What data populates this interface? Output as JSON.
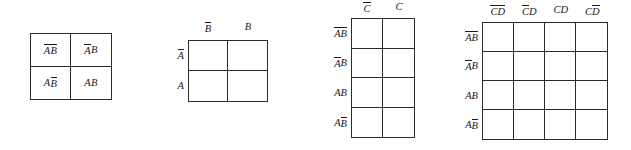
{
  "figure": {
    "type": "karnaugh-map-series",
    "background": "#ffffff",
    "ink": "#1a1a1a",
    "maps": [
      {
        "id": "map1",
        "name": "two-variable-kmap-filled",
        "variables": [
          "A",
          "B"
        ],
        "columns": 2,
        "rows": 2,
        "column_headers": [],
        "row_headers": [],
        "cells": [
          {
            "html": "<i class=\"ov\">A</i> <i class=\"ov\">B</i>",
            "text": "A̅ B̅"
          },
          {
            "html": "<i class=\"ov\">A</i> <i>B</i>",
            "text": "A̅ B"
          },
          {
            "html": "<i>A</i> <i class=\"ov\">B</i>",
            "text": "A B̅"
          },
          {
            "html": "<i>A</i> <i>B</i>",
            "text": "A B"
          }
        ]
      },
      {
        "id": "map2",
        "name": "two-variable-kmap-labeled",
        "variables": [
          "A",
          "B"
        ],
        "columns": 2,
        "rows": 2,
        "column_headers": [
          {
            "html": "<i class=\"ov\">B</i>",
            "text": "B̅"
          },
          {
            "html": "<i>B</i>",
            "text": "B"
          }
        ],
        "row_headers": [
          {
            "html": "<i class=\"ov\">A</i>",
            "text": "A̅"
          },
          {
            "html": "<i>A</i>",
            "text": "A"
          }
        ],
        "cells": [
          {
            "html": "",
            "text": ""
          },
          {
            "html": "",
            "text": ""
          },
          {
            "html": "",
            "text": ""
          },
          {
            "html": "",
            "text": ""
          }
        ]
      },
      {
        "id": "map3",
        "name": "three-variable-kmap",
        "variables": [
          "A",
          "B",
          "C"
        ],
        "columns": 2,
        "rows": 4,
        "column_headers": [
          {
            "html": "<i class=\"ov\">C</i>",
            "text": "C̅"
          },
          {
            "html": "<i>C</i>",
            "text": "C"
          }
        ],
        "row_headers": [
          {
            "html": "<i class=\"ov\">A</i> <i class=\"ov\">B</i>",
            "text": "A̅ B̅"
          },
          {
            "html": "<i class=\"ov\">A</i> <i>B</i>",
            "text": "A̅ B"
          },
          {
            "html": "<i>A</i> <i>B</i>",
            "text": "A B"
          },
          {
            "html": "<i>A</i> <i class=\"ov\">B</i>",
            "text": "A B̅"
          }
        ],
        "cells": [
          {
            "html": "",
            "text": ""
          },
          {
            "html": "",
            "text": ""
          },
          {
            "html": "",
            "text": ""
          },
          {
            "html": "",
            "text": ""
          },
          {
            "html": "",
            "text": ""
          },
          {
            "html": "",
            "text": ""
          },
          {
            "html": "",
            "text": ""
          },
          {
            "html": "",
            "text": ""
          }
        ]
      },
      {
        "id": "map4",
        "name": "four-variable-kmap",
        "variables": [
          "A",
          "B",
          "C",
          "D"
        ],
        "columns": 4,
        "rows": 4,
        "column_headers": [
          {
            "html": "<i class=\"ov\">C</i><i class=\"ov\">D</i>",
            "text": "C̅D̅"
          },
          {
            "html": "<i class=\"ov\">C</i><i>D</i>",
            "text": "C̅D"
          },
          {
            "html": "<i>C</i><i>D</i>",
            "text": "CD"
          },
          {
            "html": "<i>C</i><i class=\"ov\">D</i>",
            "text": "CD̅"
          }
        ],
        "row_headers": [
          {
            "html": "<i class=\"ov\">A</i> <i class=\"ov\">B</i>",
            "text": "A̅ B̅"
          },
          {
            "html": "<i class=\"ov\">A</i> <i>B</i>",
            "text": "A̅ B"
          },
          {
            "html": "<i>A</i> <i>B</i>",
            "text": "A B"
          },
          {
            "html": "<i>A</i> <i class=\"ov\">B</i>",
            "text": "A B̅"
          }
        ],
        "cells": [
          {
            "html": "",
            "text": ""
          },
          {
            "html": "",
            "text": ""
          },
          {
            "html": "",
            "text": ""
          },
          {
            "html": "",
            "text": ""
          },
          {
            "html": "",
            "text": ""
          },
          {
            "html": "",
            "text": ""
          },
          {
            "html": "",
            "text": ""
          },
          {
            "html": "",
            "text": ""
          },
          {
            "html": "",
            "text": ""
          },
          {
            "html": "",
            "text": ""
          },
          {
            "html": "",
            "text": ""
          },
          {
            "html": "",
            "text": ""
          },
          {
            "html": "",
            "text": ""
          },
          {
            "html": "",
            "text": ""
          },
          {
            "html": "",
            "text": ""
          },
          {
            "html": "",
            "text": ""
          }
        ]
      }
    ]
  }
}
